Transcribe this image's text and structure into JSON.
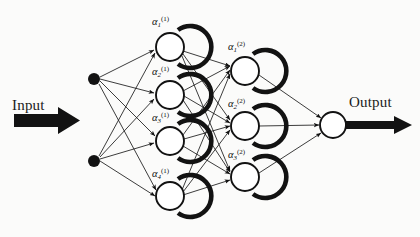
{
  "figure": {
    "kind": "neural-network-diagram",
    "title": "",
    "background_color": "#fbfbfa",
    "stroke_color": "#121212"
  },
  "io": {
    "input_label": "Input",
    "output_label": "Output"
  },
  "layers": {
    "input": {
      "name": "input-layer",
      "node_style": "filled-dot",
      "count": 2,
      "nodes": [
        {
          "id": "in-1",
          "cx": 94,
          "cy": 79,
          "r": 6
        },
        {
          "id": "in-2",
          "cx": 94,
          "cy": 161,
          "r": 6
        }
      ]
    },
    "hidden1": {
      "name": "hidden-layer-1",
      "node_style": "open-circle-with-arc",
      "count": 4,
      "nodes": [
        {
          "id": "h1-1",
          "label_base": "α",
          "label_sub": "1",
          "label_sup": "(1)",
          "cx": 170,
          "cy": 47,
          "r": 14,
          "label_x": 152,
          "label_y": 16
        },
        {
          "id": "h1-2",
          "label_base": "α",
          "label_sub": "2",
          "label_sup": "(1)",
          "cx": 170,
          "cy": 95,
          "r": 14,
          "label_x": 152,
          "label_y": 66
        },
        {
          "id": "h1-3",
          "label_base": "α",
          "label_sub": "3",
          "label_sup": "(1)",
          "cx": 170,
          "cy": 141,
          "r": 14,
          "label_x": 152,
          "label_y": 112
        },
        {
          "id": "h1-4",
          "label_base": "α",
          "label_sub": "4",
          "label_sup": "(1)",
          "cx": 170,
          "cy": 196,
          "r": 14,
          "label_x": 152,
          "label_y": 168
        }
      ]
    },
    "hidden2": {
      "name": "hidden-layer-2",
      "node_style": "open-circle-with-arc",
      "count": 3,
      "nodes": [
        {
          "id": "h2-1",
          "label_base": "α",
          "label_sub": "1",
          "label_sup": "(2)",
          "cx": 245,
          "cy": 71,
          "r": 14,
          "label_x": 228,
          "label_y": 41
        },
        {
          "id": "h2-2",
          "label_base": "α",
          "label_sub": "2",
          "label_sup": "(2)",
          "cx": 245,
          "cy": 126,
          "r": 14,
          "label_x": 228,
          "label_y": 98
        },
        {
          "id": "h2-3",
          "label_base": "α",
          "label_sub": "3",
          "label_sup": "(2)",
          "cx": 245,
          "cy": 177,
          "r": 14,
          "label_x": 228,
          "label_y": 149
        }
      ]
    },
    "output": {
      "name": "output-layer",
      "node_style": "open-circle",
      "count": 1,
      "nodes": [
        {
          "id": "out-1",
          "cx": 333,
          "cy": 125,
          "r": 13
        }
      ]
    }
  },
  "connections": {
    "input_to_hidden1": [
      [
        "in-1",
        "h1-1"
      ],
      [
        "in-1",
        "h1-2"
      ],
      [
        "in-1",
        "h1-3"
      ],
      [
        "in-1",
        "h1-4"
      ],
      [
        "in-2",
        "h1-1"
      ],
      [
        "in-2",
        "h1-2"
      ],
      [
        "in-2",
        "h1-3"
      ],
      [
        "in-2",
        "h1-4"
      ]
    ],
    "hidden1_to_hidden2": [
      [
        "h1-1",
        "h2-1"
      ],
      [
        "h1-1",
        "h2-2"
      ],
      [
        "h1-1",
        "h2-3"
      ],
      [
        "h1-2",
        "h2-1"
      ],
      [
        "h1-2",
        "h2-2"
      ],
      [
        "h1-2",
        "h2-3"
      ],
      [
        "h1-3",
        "h2-1"
      ],
      [
        "h1-3",
        "h2-2"
      ],
      [
        "h1-3",
        "h2-3"
      ],
      [
        "h1-4",
        "h2-1"
      ],
      [
        "h1-4",
        "h2-2"
      ],
      [
        "h1-4",
        "h2-3"
      ]
    ],
    "hidden2_to_output": [
      [
        "h2-1",
        "out-1"
      ],
      [
        "h2-2",
        "out-1"
      ],
      [
        "h2-3",
        "out-1"
      ]
    ]
  },
  "arrows": {
    "input_arrow": {
      "x1": 14,
      "y1": 120,
      "x2": 78,
      "y2": 120,
      "thickness": 13
    },
    "output_arrow": {
      "x1": 346,
      "y1": 125,
      "x2": 410,
      "y2": 125,
      "thickness": 9
    }
  }
}
